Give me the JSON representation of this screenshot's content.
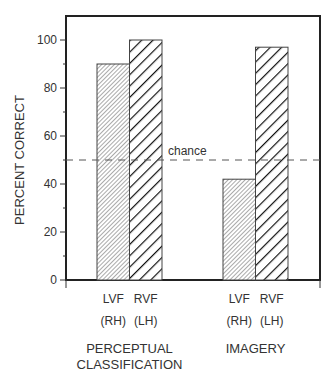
{
  "chart_data": {
    "type": "bar",
    "title": "",
    "xlabel": "",
    "ylabel": "PERCENT CORRECT",
    "ylim": [
      0,
      110
    ],
    "yticks": [
      0,
      20,
      40,
      60,
      80,
      100
    ],
    "grid": false,
    "legend": null,
    "groups": [
      {
        "name": "PERCEPTUAL CLASSIFICATION",
        "name_lines": [
          "PERCEPTUAL",
          "CLASSIFICATION"
        ],
        "bars": [
          {
            "field": "LVF",
            "hemisphere": "(RH)",
            "value": 90,
            "pattern": "fine-hatch"
          },
          {
            "field": "RVF",
            "hemisphere": "(LH)",
            "value": 100,
            "pattern": "bold-hatch"
          }
        ]
      },
      {
        "name": "IMAGERY",
        "name_lines": [
          "IMAGERY"
        ],
        "bars": [
          {
            "field": "LVF",
            "hemisphere": "(RH)",
            "value": 42,
            "pattern": "fine-hatch"
          },
          {
            "field": "RVF",
            "hemisphere": "(LH)",
            "value": 97,
            "pattern": "bold-hatch"
          }
        ]
      }
    ],
    "series": [
      {
        "name": "LVF (RH)",
        "values": [
          90,
          42
        ]
      },
      {
        "name": "RVF (LH)",
        "values": [
          100,
          97
        ]
      }
    ],
    "categories": [
      "PERCEPTUAL CLASSIFICATION",
      "IMAGERY"
    ],
    "reference_line": {
      "label": "chance",
      "value": 50,
      "style": "dashed"
    }
  }
}
